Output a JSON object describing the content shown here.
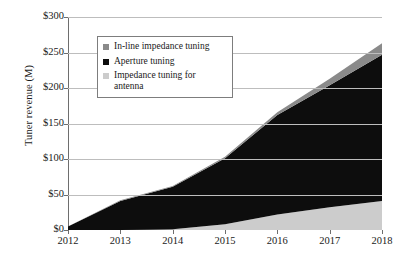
{
  "chart_data": {
    "type": "area",
    "stacked": true,
    "title": "",
    "subtitle": "",
    "xlabel": "",
    "ylabel": "Tuner revenue (M)",
    "categories": [
      "2012",
      "2013",
      "2014",
      "2015",
      "2016",
      "2017",
      "2018"
    ],
    "x": [
      2012,
      2013,
      2014,
      2015,
      2016,
      2017,
      2018
    ],
    "series": [
      {
        "name": "Impedance tuning for antenna",
        "color": "#cccccc",
        "values": [
          0,
          0,
          1,
          8,
          22,
          32,
          41
        ]
      },
      {
        "name": "Aperture tuning",
        "color": "#0d0d0d",
        "values": [
          5,
          41,
          60,
          93,
          140,
          172,
          206
        ]
      },
      {
        "name": "In-line impedance tuning",
        "color": "#8a8a8a",
        "values": [
          0,
          1,
          1,
          2,
          4,
          9,
          16
        ]
      }
    ],
    "cumulative_totals": [
      5,
      42,
      62,
      103,
      166,
      213,
      263
    ],
    "ylim": [
      0,
      300
    ],
    "ytick_values": [
      0,
      50,
      100,
      150,
      200,
      250,
      300
    ],
    "ytick_labels": [
      "$0",
      "$50",
      "$100",
      "$150",
      "$200",
      "$250",
      "$300"
    ],
    "xtick_labels": [
      "2012",
      "2013",
      "2014",
      "2015",
      "2016",
      "2017",
      "2018"
    ],
    "grid": true,
    "grid_axis": "y",
    "legend_position": "upper-left-inside",
    "legend_entries": [
      {
        "label": "In-line impedance tuning",
        "color": "#8a8a8a"
      },
      {
        "label": "Aperture tuning",
        "color": "#0d0d0d"
      },
      {
        "label": "Impedance tuning for antenna",
        "color": "#cccccc"
      }
    ]
  },
  "axis": {
    "y_title": "Tuner revenue (M)"
  },
  "legend": {
    "items": [
      {
        "label": "In-line impedance tuning"
      },
      {
        "label": "Aperture tuning"
      },
      {
        "label": "Impedance tuning for antenna"
      }
    ]
  },
  "colors": {
    "inline_impedance": "#8a8a8a",
    "aperture": "#0d0d0d",
    "impedance_antenna": "#cccccc",
    "grid": "#bdbdbd",
    "axis": "#6e6e6e",
    "text": "#1a1a1a",
    "background": "#ffffff"
  }
}
